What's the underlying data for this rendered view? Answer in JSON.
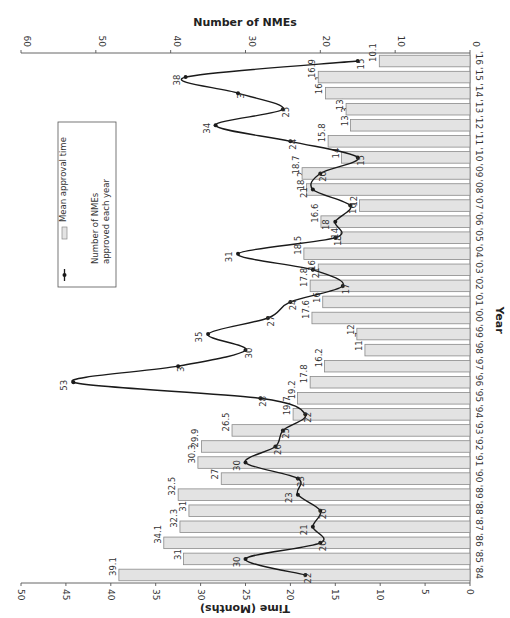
{
  "chart_data": {
    "type": "bar+line",
    "orientation": "rotated 90deg clockwise (years run top-to-bottom from '16 to '84 on right side)",
    "top_axis": {
      "title": "Number of NMEs",
      "ticks": [
        0,
        10,
        20,
        30,
        40,
        50,
        60
      ],
      "range": [
        0,
        60
      ]
    },
    "bottom_axis": {
      "title": "Time (Months)",
      "ticks": [
        0,
        5,
        10,
        15,
        20,
        25,
        30,
        35,
        40,
        45,
        50
      ],
      "range": [
        0,
        50
      ]
    },
    "category_axis_title": "Year",
    "categories": [
      "'84",
      "'85",
      "'86",
      "'87",
      "'88",
      "'89",
      "'90",
      "'91",
      "'92",
      "'93",
      "'94",
      "'95",
      "'96",
      "'97",
      "'98",
      "'99",
      "'00",
      "'01",
      "'02",
      "'03",
      "'04",
      "'05",
      "'06",
      "'07",
      "'08",
      "'09",
      "'10",
      "'11",
      "'12",
      "'13",
      "'14",
      "'15",
      "'16"
    ],
    "series": [
      {
        "name": "Mean approval time",
        "type": "bar",
        "axis": "Time (Months)",
        "values": [
          39.1,
          31.9,
          34.1,
          32.3,
          31.3,
          32.5,
          27.7,
          30.3,
          29.9,
          26.5,
          19.7,
          19.2,
          17.8,
          16.2,
          11.7,
          12.6,
          17.6,
          16.4,
          17.8,
          16.9,
          18.5,
          14.4,
          16.6,
          12.3,
          18.2,
          18.7,
          14.3,
          15.8,
          13.3,
          13.8,
          16.1,
          16.9,
          10.1
        ],
        "labels": [
          "39.1",
          "31.9",
          "34.1",
          "32.3",
          "31.3",
          "32.5",
          "27.7",
          "30.3",
          "29.9",
          "26.5",
          "19.7",
          "19.2",
          "17.8",
          "16.2",
          "11.7",
          "12.6",
          "17.6",
          "16.4",
          "17.8",
          "16.9",
          "18.5",
          "14.4",
          "16.6",
          "12.3",
          "18.2",
          "18.7",
          "14.3",
          "15.8",
          "13.3",
          "13.8",
          "16.1",
          "16.9",
          "10.1"
        ]
      },
      {
        "name": "Number of NMEs approved each year",
        "type": "line",
        "axis": "Number of NMEs",
        "values": [
          22,
          30,
          20,
          21,
          20,
          23,
          23,
          30,
          26,
          25,
          22,
          28,
          53,
          39,
          30,
          35,
          27,
          24,
          17,
          21,
          31,
          18,
          18,
          16,
          21,
          20,
          15,
          24,
          34,
          25,
          31,
          38,
          15
        ],
        "labels": [
          "22",
          "30",
          "20",
          "21",
          "20",
          "23",
          "23",
          "30",
          "26",
          "25",
          "22",
          "28",
          "53",
          "3",
          "30",
          "35",
          "27",
          "24",
          "17",
          "21",
          "31",
          "18",
          "18",
          "16",
          "21",
          "20",
          "15",
          "24",
          "34",
          "25",
          "3",
          "38",
          "15"
        ]
      }
    ],
    "legend": {
      "items": [
        "Mean approval time",
        "Number of NMEs approved each year"
      ],
      "position": "upper-left (rotated)"
    }
  },
  "legend": {
    "bar_label": "Mean approval time",
    "line_label_1": "Number of NMEs",
    "line_label_2": "approved each year"
  },
  "colors": {
    "bar_fill": "#e3e3e3",
    "bar_stroke": "#8a8a8a",
    "line": "#1a1a1a",
    "axis": "#555555"
  }
}
